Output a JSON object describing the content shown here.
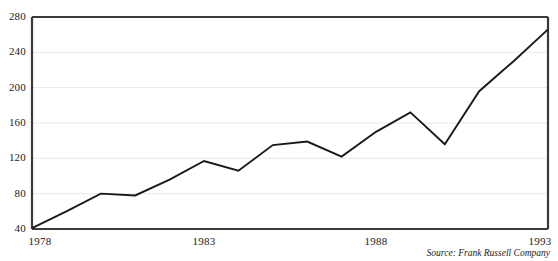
{
  "chart_data": {
    "type": "line",
    "title": "",
    "subtitle": "",
    "xlabel": "",
    "ylabel": "",
    "x": [
      1978,
      1979,
      1980,
      1981,
      1982,
      1983,
      1984,
      1985,
      1986,
      1987,
      1988,
      1989,
      1990,
      1991,
      1992,
      1993
    ],
    "values": [
      41,
      60,
      80,
      78,
      96,
      117,
      106,
      135,
      139,
      122,
      150,
      172,
      136,
      196,
      230,
      266
    ],
    "series": [
      {
        "name": "Value",
        "values": [
          41,
          60,
          80,
          78,
          96,
          117,
          106,
          135,
          139,
          122,
          150,
          172,
          136,
          196,
          230,
          266
        ]
      }
    ],
    "xlim": [
      1978,
      1993
    ],
    "ylim": [
      40,
      280
    ],
    "x_ticks": [
      1978,
      1983,
      1988,
      1993
    ],
    "x_tick_labels": [
      "1978",
      "1983",
      "1988",
      "1993"
    ],
    "y_ticks": [
      40,
      80,
      120,
      160,
      200,
      240,
      280
    ],
    "y_tick_labels": [
      "40",
      "80",
      "120",
      "160",
      "200",
      "240",
      "280"
    ],
    "grid": true,
    "grid_axis": "y",
    "legend": false,
    "legend_position": "none",
    "line_color": "#1a1a1a",
    "grid_color": "#e8e8e8",
    "axis_color": "#3a3a3a",
    "background_color": "#ffffff",
    "annotations": [
      {
        "name": "source-note",
        "text": "Source: Frank Russell Company",
        "position": "bottom-right",
        "style": "italic"
      }
    ]
  },
  "source": {
    "text": "Source: Frank Russell Company"
  }
}
